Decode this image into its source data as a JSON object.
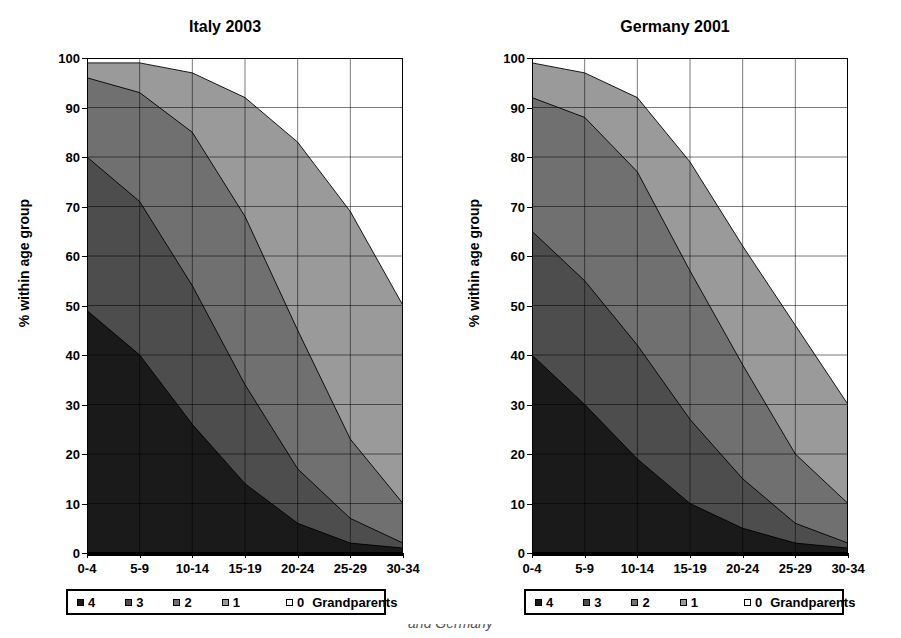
{
  "figure": {
    "ylabel": "% within age group",
    "caption_fragment": "and Germany"
  },
  "legend": {
    "items": [
      {
        "label": "4",
        "color": "#1a1a1a"
      },
      {
        "label": "3",
        "color": "#4d4d4d"
      },
      {
        "label": "2",
        "color": "#707070"
      },
      {
        "label": "1",
        "color": "#9a9a9a"
      },
      {
        "label": "0",
        "color": "#ffffff"
      }
    ],
    "unit": "Grandparents"
  },
  "axes": {
    "yticks": [
      0,
      10,
      20,
      30,
      40,
      50,
      60,
      70,
      80,
      90,
      100
    ],
    "xticks": [
      "0-4",
      "5-9",
      "10-14",
      "15-19",
      "20-24",
      "25-29",
      "30-34"
    ],
    "ymin": 0,
    "ymax": 100
  },
  "chart_data": [
    {
      "type": "area",
      "title": "Italy 2003",
      "xlabel": "",
      "ylabel": "% within age group",
      "ylim": [
        0,
        100
      ],
      "grid": true,
      "legend_position": "below",
      "categories": [
        "0-4",
        "5-9",
        "10-14",
        "15-19",
        "20-24",
        "25-29",
        "30-34"
      ],
      "series": [
        {
          "name": "4",
          "color": "#1a1a1a",
          "values": [
            49,
            40,
            26,
            14,
            6,
            2,
            1
          ]
        },
        {
          "name": "3",
          "color": "#4d4d4d",
          "values": [
            31,
            31,
            28,
            20,
            11,
            5,
            1
          ]
        },
        {
          "name": "2",
          "color": "#707070",
          "values": [
            16,
            22,
            31,
            34,
            28,
            16,
            8
          ]
        },
        {
          "name": "1",
          "color": "#9a9a9a",
          "values": [
            3,
            6,
            12,
            24,
            38,
            46,
            40
          ]
        },
        {
          "name": "0",
          "color": "#ffffff",
          "values": [
            1,
            1,
            3,
            8,
            17,
            31,
            50
          ]
        }
      ],
      "cumulative": [
        {
          "name": "4",
          "values": [
            49,
            40,
            26,
            14,
            6,
            2,
            1
          ]
        },
        {
          "name": "3",
          "values": [
            80,
            71,
            54,
            34,
            17,
            7,
            2
          ]
        },
        {
          "name": "2",
          "values": [
            96,
            93,
            85,
            68,
            45,
            23,
            10
          ]
        },
        {
          "name": "1",
          "values": [
            99,
            99,
            97,
            92,
            83,
            69,
            50
          ]
        },
        {
          "name": "0",
          "values": [
            100,
            100,
            100,
            100,
            100,
            100,
            100
          ]
        }
      ]
    },
    {
      "type": "area",
      "title": "Germany 2001",
      "xlabel": "",
      "ylabel": "% within age group",
      "ylim": [
        0,
        100
      ],
      "grid": true,
      "legend_position": "below",
      "categories": [
        "0-4",
        "5-9",
        "10-14",
        "15-19",
        "20-24",
        "25-29",
        "30-34"
      ],
      "series": [
        {
          "name": "4",
          "color": "#1a1a1a",
          "values": [
            40,
            30,
            19,
            10,
            5,
            2,
            1
          ]
        },
        {
          "name": "3",
          "color": "#4d4d4d",
          "values": [
            25,
            25,
            23,
            17,
            10,
            4,
            1
          ]
        },
        {
          "name": "2",
          "color": "#707070",
          "values": [
            27,
            33,
            35,
            30,
            23,
            14,
            8
          ]
        },
        {
          "name": "1",
          "color": "#9a9a9a",
          "values": [
            7,
            9,
            15,
            22,
            24,
            26,
            20
          ]
        },
        {
          "name": "0",
          "color": "#ffffff",
          "values": [
            1,
            3,
            8,
            21,
            38,
            54,
            70
          ]
        }
      ],
      "cumulative": [
        {
          "name": "4",
          "values": [
            40,
            30,
            19,
            10,
            5,
            2,
            1
          ]
        },
        {
          "name": "3",
          "values": [
            65,
            55,
            42,
            27,
            15,
            6,
            2
          ]
        },
        {
          "name": "2",
          "values": [
            92,
            88,
            77,
            57,
            38,
            20,
            10
          ]
        },
        {
          "name": "1",
          "values": [
            99,
            97,
            92,
            79,
            62,
            46,
            30
          ]
        },
        {
          "name": "0",
          "values": [
            100,
            100,
            100,
            100,
            100,
            100,
            100
          ]
        }
      ]
    }
  ]
}
